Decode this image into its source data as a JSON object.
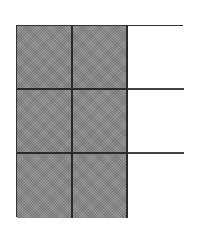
{
  "diagram": {
    "type": "fraction-grid",
    "rows": 3,
    "columns": 3,
    "shaded_count": 6,
    "total_count": 9,
    "shaded_columns": [
      0,
      1
    ],
    "colors": {
      "shaded": "#8e8e8e",
      "unshaded": "#ffffff",
      "border": "#2a2a2a"
    },
    "cells": [
      {
        "row": 0,
        "col": 0,
        "shaded": true
      },
      {
        "row": 0,
        "col": 1,
        "shaded": true
      },
      {
        "row": 0,
        "col": 2,
        "shaded": false
      },
      {
        "row": 1,
        "col": 0,
        "shaded": true
      },
      {
        "row": 1,
        "col": 1,
        "shaded": true
      },
      {
        "row": 1,
        "col": 2,
        "shaded": false
      },
      {
        "row": 2,
        "col": 0,
        "shaded": true
      },
      {
        "row": 2,
        "col": 1,
        "shaded": true
      },
      {
        "row": 2,
        "col": 2,
        "shaded": false
      }
    ]
  }
}
